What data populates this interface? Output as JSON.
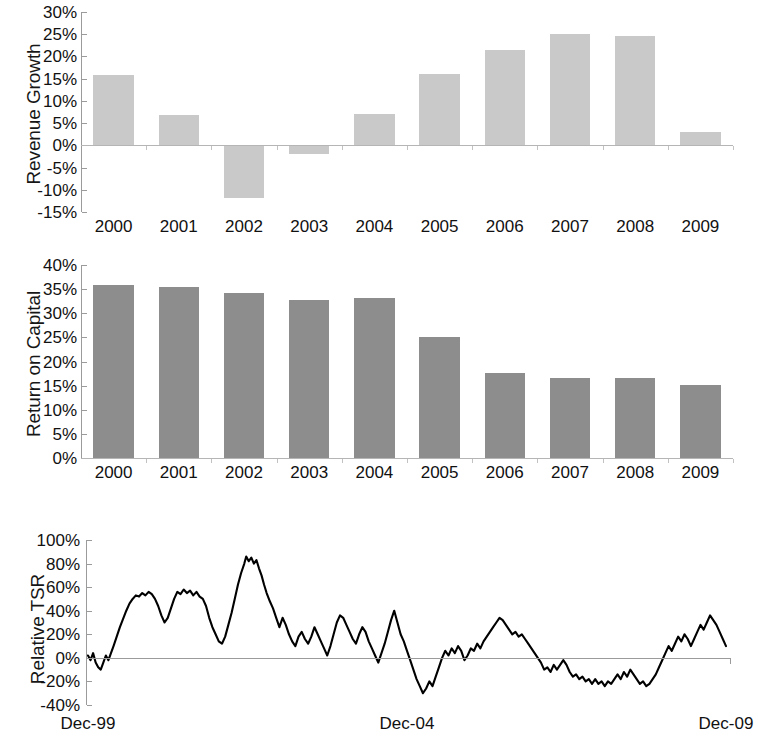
{
  "chart_data": [
    {
      "type": "bar",
      "title": "",
      "ylabel": "Revenue Growth",
      "xlabel": "",
      "categories": [
        "2000",
        "2001",
        "2002",
        "2003",
        "2004",
        "2005",
        "2006",
        "2007",
        "2008",
        "2009"
      ],
      "values": [
        15.8,
        6.8,
        -11.9,
        -2.0,
        7.0,
        16.0,
        21.5,
        25.0,
        24.5,
        3.0
      ],
      "value_unit": "percent",
      "ylim": [
        -15,
        30
      ],
      "ytick_labels": [
        "30%",
        "25%",
        "20%",
        "15%",
        "10%",
        "5%",
        "0%",
        "-5%",
        "-10%",
        "-15%"
      ],
      "ytick_values": [
        30,
        25,
        20,
        15,
        10,
        5,
        0,
        -5,
        -10,
        -15
      ],
      "grid": false,
      "legend": "none",
      "bar_color": "#c9c9c9"
    },
    {
      "type": "bar",
      "title": "",
      "ylabel": "Return on Capital",
      "xlabel": "",
      "categories": [
        "2000",
        "2001",
        "2002",
        "2003",
        "2004",
        "2005",
        "2006",
        "2007",
        "2008",
        "2009"
      ],
      "values": [
        35.9,
        35.5,
        34.3,
        32.8,
        33.1,
        25.0,
        17.6,
        16.6,
        16.6,
        15.1
      ],
      "value_unit": "percent",
      "ylim": [
        0,
        40
      ],
      "ytick_labels": [
        "40%",
        "35%",
        "30%",
        "25%",
        "20%",
        "15%",
        "10%",
        "5%",
        "0%"
      ],
      "ytick_values": [
        40,
        35,
        30,
        25,
        20,
        15,
        10,
        5,
        0
      ],
      "grid": false,
      "legend": "none",
      "bar_color": "#8d8d8d"
    },
    {
      "type": "line",
      "title": "",
      "ylabel": "Relative TSR",
      "xlabel": "",
      "x_tick_labels": [
        "Dec-99",
        "Dec-04",
        "Dec-09"
      ],
      "x_tick_positions": [
        0,
        0.5,
        1.0
      ],
      "ylim": [
        -40,
        100
      ],
      "ytick_labels": [
        "100%",
        "80%",
        "60%",
        "40%",
        "20%",
        "0%",
        "-20%",
        "-40%"
      ],
      "ytick_values": [
        100,
        80,
        60,
        40,
        20,
        0,
        -20,
        -40
      ],
      "value_unit": "percent",
      "grid": false,
      "legend": "none",
      "line_color": "#000000",
      "zero_line_color": "#9b9b9b",
      "series": [
        {
          "name": "Relative TSR",
          "points": [
            [
              0.0,
              2
            ],
            [
              0.004,
              -2
            ],
            [
              0.008,
              4
            ],
            [
              0.012,
              -4
            ],
            [
              0.016,
              -8
            ],
            [
              0.02,
              -10
            ],
            [
              0.024,
              -4
            ],
            [
              0.028,
              2
            ],
            [
              0.032,
              -2
            ],
            [
              0.036,
              4
            ],
            [
              0.04,
              10
            ],
            [
              0.045,
              18
            ],
            [
              0.05,
              26
            ],
            [
              0.055,
              33
            ],
            [
              0.06,
              40
            ],
            [
              0.065,
              46
            ],
            [
              0.07,
              50
            ],
            [
              0.075,
              53
            ],
            [
              0.08,
              52
            ],
            [
              0.085,
              55
            ],
            [
              0.09,
              53
            ],
            [
              0.095,
              56
            ],
            [
              0.1,
              54
            ],
            [
              0.105,
              50
            ],
            [
              0.11,
              44
            ],
            [
              0.115,
              36
            ],
            [
              0.12,
              30
            ],
            [
              0.125,
              34
            ],
            [
              0.13,
              42
            ],
            [
              0.135,
              50
            ],
            [
              0.14,
              56
            ],
            [
              0.145,
              54
            ],
            [
              0.15,
              58
            ],
            [
              0.155,
              55
            ],
            [
              0.16,
              57
            ],
            [
              0.165,
              53
            ],
            [
              0.17,
              56
            ],
            [
              0.175,
              52
            ],
            [
              0.18,
              50
            ],
            [
              0.185,
              44
            ],
            [
              0.19,
              34
            ],
            [
              0.195,
              26
            ],
            [
              0.2,
              20
            ],
            [
              0.205,
              14
            ],
            [
              0.21,
              12
            ],
            [
              0.215,
              18
            ],
            [
              0.22,
              28
            ],
            [
              0.225,
              38
            ],
            [
              0.23,
              50
            ],
            [
              0.235,
              62
            ],
            [
              0.24,
              72
            ],
            [
              0.245,
              80
            ],
            [
              0.248,
              86
            ],
            [
              0.252,
              82
            ],
            [
              0.256,
              85
            ],
            [
              0.26,
              80
            ],
            [
              0.264,
              83
            ],
            [
              0.268,
              76
            ],
            [
              0.272,
              70
            ],
            [
              0.276,
              62
            ],
            [
              0.28,
              55
            ],
            [
              0.285,
              48
            ],
            [
              0.29,
              42
            ],
            [
              0.295,
              34
            ],
            [
              0.3,
              26
            ],
            [
              0.305,
              34
            ],
            [
              0.31,
              28
            ],
            [
              0.315,
              20
            ],
            [
              0.32,
              14
            ],
            [
              0.325,
              10
            ],
            [
              0.33,
              18
            ],
            [
              0.335,
              22
            ],
            [
              0.34,
              16
            ],
            [
              0.345,
              12
            ],
            [
              0.35,
              18
            ],
            [
              0.355,
              26
            ],
            [
              0.36,
              20
            ],
            [
              0.365,
              14
            ],
            [
              0.37,
              8
            ],
            [
              0.375,
              2
            ],
            [
              0.38,
              10
            ],
            [
              0.385,
              20
            ],
            [
              0.39,
              30
            ],
            [
              0.395,
              36
            ],
            [
              0.4,
              34
            ],
            [
              0.405,
              28
            ],
            [
              0.41,
              22
            ],
            [
              0.415,
              16
            ],
            [
              0.42,
              12
            ],
            [
              0.425,
              20
            ],
            [
              0.43,
              26
            ],
            [
              0.435,
              22
            ],
            [
              0.44,
              14
            ],
            [
              0.445,
              8
            ],
            [
              0.45,
              2
            ],
            [
              0.455,
              -4
            ],
            [
              0.46,
              4
            ],
            [
              0.465,
              12
            ],
            [
              0.47,
              22
            ],
            [
              0.475,
              32
            ],
            [
              0.48,
              40
            ],
            [
              0.485,
              30
            ],
            [
              0.49,
              20
            ],
            [
              0.495,
              14
            ],
            [
              0.5,
              6
            ],
            [
              0.505,
              -2
            ],
            [
              0.51,
              -10
            ],
            [
              0.515,
              -18
            ],
            [
              0.52,
              -24
            ],
            [
              0.525,
              -30
            ],
            [
              0.53,
              -26
            ],
            [
              0.535,
              -20
            ],
            [
              0.54,
              -24
            ],
            [
              0.545,
              -16
            ],
            [
              0.55,
              -8
            ],
            [
              0.555,
              0
            ],
            [
              0.56,
              6
            ],
            [
              0.565,
              2
            ],
            [
              0.57,
              8
            ],
            [
              0.575,
              4
            ],
            [
              0.58,
              10
            ],
            [
              0.585,
              6
            ],
            [
              0.59,
              -2
            ],
            [
              0.595,
              2
            ],
            [
              0.6,
              8
            ],
            [
              0.605,
              6
            ],
            [
              0.61,
              12
            ],
            [
              0.615,
              8
            ],
            [
              0.62,
              14
            ],
            [
              0.625,
              18
            ],
            [
              0.63,
              22
            ],
            [
              0.635,
              26
            ],
            [
              0.64,
              30
            ],
            [
              0.645,
              34
            ],
            [
              0.65,
              32
            ],
            [
              0.655,
              28
            ],
            [
              0.66,
              24
            ],
            [
              0.665,
              20
            ],
            [
              0.67,
              22
            ],
            [
              0.675,
              18
            ],
            [
              0.68,
              20
            ],
            [
              0.685,
              16
            ],
            [
              0.69,
              12
            ],
            [
              0.695,
              8
            ],
            [
              0.7,
              4
            ],
            [
              0.705,
              0
            ],
            [
              0.71,
              -4
            ],
            [
              0.715,
              -10
            ],
            [
              0.72,
              -8
            ],
            [
              0.725,
              -12
            ],
            [
              0.73,
              -6
            ],
            [
              0.735,
              -10
            ],
            [
              0.74,
              -6
            ],
            [
              0.745,
              -2
            ],
            [
              0.75,
              -6
            ],
            [
              0.755,
              -12
            ],
            [
              0.76,
              -16
            ],
            [
              0.765,
              -14
            ],
            [
              0.77,
              -18
            ],
            [
              0.775,
              -16
            ],
            [
              0.78,
              -20
            ],
            [
              0.785,
              -18
            ],
            [
              0.79,
              -22
            ],
            [
              0.795,
              -18
            ],
            [
              0.8,
              -22
            ],
            [
              0.805,
              -20
            ],
            [
              0.81,
              -24
            ],
            [
              0.815,
              -20
            ],
            [
              0.82,
              -22
            ],
            [
              0.825,
              -18
            ],
            [
              0.83,
              -14
            ],
            [
              0.835,
              -18
            ],
            [
              0.84,
              -12
            ],
            [
              0.845,
              -16
            ],
            [
              0.85,
              -10
            ],
            [
              0.855,
              -14
            ],
            [
              0.86,
              -18
            ],
            [
              0.865,
              -22
            ],
            [
              0.87,
              -20
            ],
            [
              0.875,
              -24
            ],
            [
              0.88,
              -22
            ],
            [
              0.885,
              -18
            ],
            [
              0.89,
              -14
            ],
            [
              0.895,
              -8
            ],
            [
              0.9,
              -2
            ],
            [
              0.905,
              4
            ],
            [
              0.91,
              10
            ],
            [
              0.915,
              6
            ],
            [
              0.92,
              12
            ],
            [
              0.925,
              18
            ],
            [
              0.93,
              14
            ],
            [
              0.935,
              20
            ],
            [
              0.94,
              16
            ],
            [
              0.945,
              10
            ],
            [
              0.95,
              16
            ],
            [
              0.955,
              22
            ],
            [
              0.96,
              28
            ],
            [
              0.965,
              24
            ],
            [
              0.97,
              30
            ],
            [
              0.975,
              36
            ],
            [
              0.98,
              32
            ],
            [
              0.985,
              28
            ],
            [
              0.99,
              22
            ],
            [
              0.995,
              16
            ],
            [
              1.0,
              10
            ]
          ]
        }
      ]
    }
  ],
  "charts": {
    "revenue_growth": {
      "ylabel": "Revenue Growth",
      "yticks": [
        "30%",
        "25%",
        "20%",
        "15%",
        "10%",
        "5%",
        "0%",
        "-5%",
        "-10%",
        "-15%"
      ],
      "xticks": [
        "2000",
        "2001",
        "2002",
        "2003",
        "2004",
        "2005",
        "2006",
        "2007",
        "2008",
        "2009"
      ]
    },
    "return_on_capital": {
      "ylabel": "Return on Capital",
      "yticks": [
        "40%",
        "35%",
        "30%",
        "25%",
        "20%",
        "15%",
        "10%",
        "5%",
        "0%"
      ],
      "xticks": [
        "2000",
        "2001",
        "2002",
        "2003",
        "2004",
        "2005",
        "2006",
        "2007",
        "2008",
        "2009"
      ]
    },
    "relative_tsr": {
      "ylabel": "Relative TSR",
      "yticks": [
        "100%",
        "80%",
        "60%",
        "40%",
        "20%",
        "0%",
        "-20%",
        "-40%"
      ],
      "xticks": [
        "Dec-99",
        "Dec-04",
        "Dec-09"
      ]
    }
  }
}
